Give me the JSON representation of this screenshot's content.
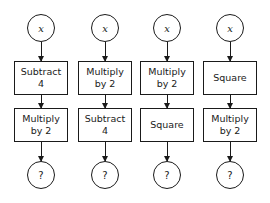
{
  "diagram": {
    "columns": [
      {
        "input": "x",
        "steps": [
          "Subtract\n4",
          "Multiply\nby 2"
        ],
        "output": "?"
      },
      {
        "input": "x",
        "steps": [
          "Multiply\nby 2",
          "Subtract\n4"
        ],
        "output": "?"
      },
      {
        "input": "x",
        "steps": [
          "Multiply\nby 2",
          "Square"
        ],
        "output": "?"
      },
      {
        "input": "x",
        "steps": [
          "Square",
          "Multiply\nby 2"
        ],
        "output": "?"
      }
    ],
    "colors": {
      "stroke": "#1a1a1a",
      "background": "#ffffff"
    }
  }
}
